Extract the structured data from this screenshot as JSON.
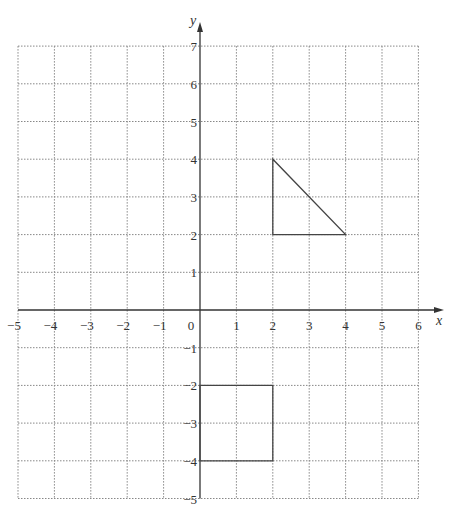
{
  "grid": {
    "x_min": -5,
    "x_max": 6,
    "y_min": -5,
    "y_max": 7,
    "origin_px": [
      200,
      310
    ],
    "unit_px_x": 36.4,
    "unit_px_y": 37.7,
    "grid_color": "#888888",
    "axis_color": "#333333"
  },
  "axes": {
    "x_label": "x",
    "y_label": "y",
    "origin_label": "0",
    "x_ticks": [
      "-5",
      "-4",
      "-3",
      "-2",
      "-1",
      "1",
      "2",
      "3",
      "4",
      "5",
      "6"
    ],
    "y_ticks": [
      "7",
      "6",
      "5",
      "4",
      "3",
      "2",
      "1",
      "-1",
      "-2",
      "-3",
      "-4",
      "-5"
    ]
  },
  "shapes": {
    "triangle": {
      "name": "triangle",
      "vertices": [
        [
          2,
          4
        ],
        [
          2,
          2
        ],
        [
          4,
          2
        ]
      ]
    },
    "square": {
      "name": "square",
      "vertices": [
        [
          0,
          -2
        ],
        [
          2,
          -2
        ],
        [
          2,
          -4
        ],
        [
          0,
          -4
        ]
      ]
    }
  }
}
